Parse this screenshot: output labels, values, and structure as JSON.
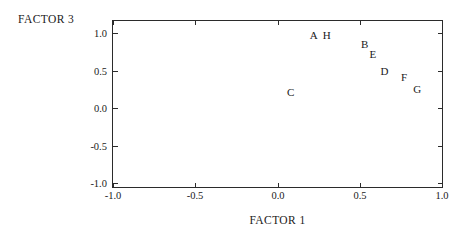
{
  "chart_data": {
    "type": "scatter",
    "title": "",
    "xlabel": "FACTOR 1",
    "ylabel": "FACTOR 3",
    "xlim": [
      -1.0,
      1.0
    ],
    "ylim": [
      -1.0,
      1.0
    ],
    "xticks": [
      "-1.0",
      "-0.5",
      "0.0",
      "0.5",
      "1.0"
    ],
    "xtick_values": [
      -1.0,
      -0.5,
      0.0,
      0.5,
      1.0
    ],
    "yticks": [
      "1.0",
      "0.5",
      "0.0",
      "-0.5",
      "-1.0"
    ],
    "ytick_values": [
      1.0,
      0.5,
      0.0,
      -0.5,
      -1.0
    ],
    "grid": false,
    "legend": "none",
    "marker_style": "text-label",
    "points": [
      {
        "label": "A",
        "x": 0.22,
        "y": 0.97
      },
      {
        "label": "H",
        "x": 0.3,
        "y": 0.97
      },
      {
        "label": "B",
        "x": 0.53,
        "y": 0.86
      },
      {
        "label": "E",
        "x": 0.58,
        "y": 0.72
      },
      {
        "label": "D",
        "x": 0.65,
        "y": 0.5
      },
      {
        "label": "F",
        "x": 0.77,
        "y": 0.42
      },
      {
        "label": "G",
        "x": 0.85,
        "y": 0.26
      },
      {
        "label": "C",
        "x": 0.08,
        "y": 0.21
      }
    ]
  },
  "axis_color": "#2b2b2b",
  "text_color": "#1a1a1a",
  "background_color": "#ffffff"
}
